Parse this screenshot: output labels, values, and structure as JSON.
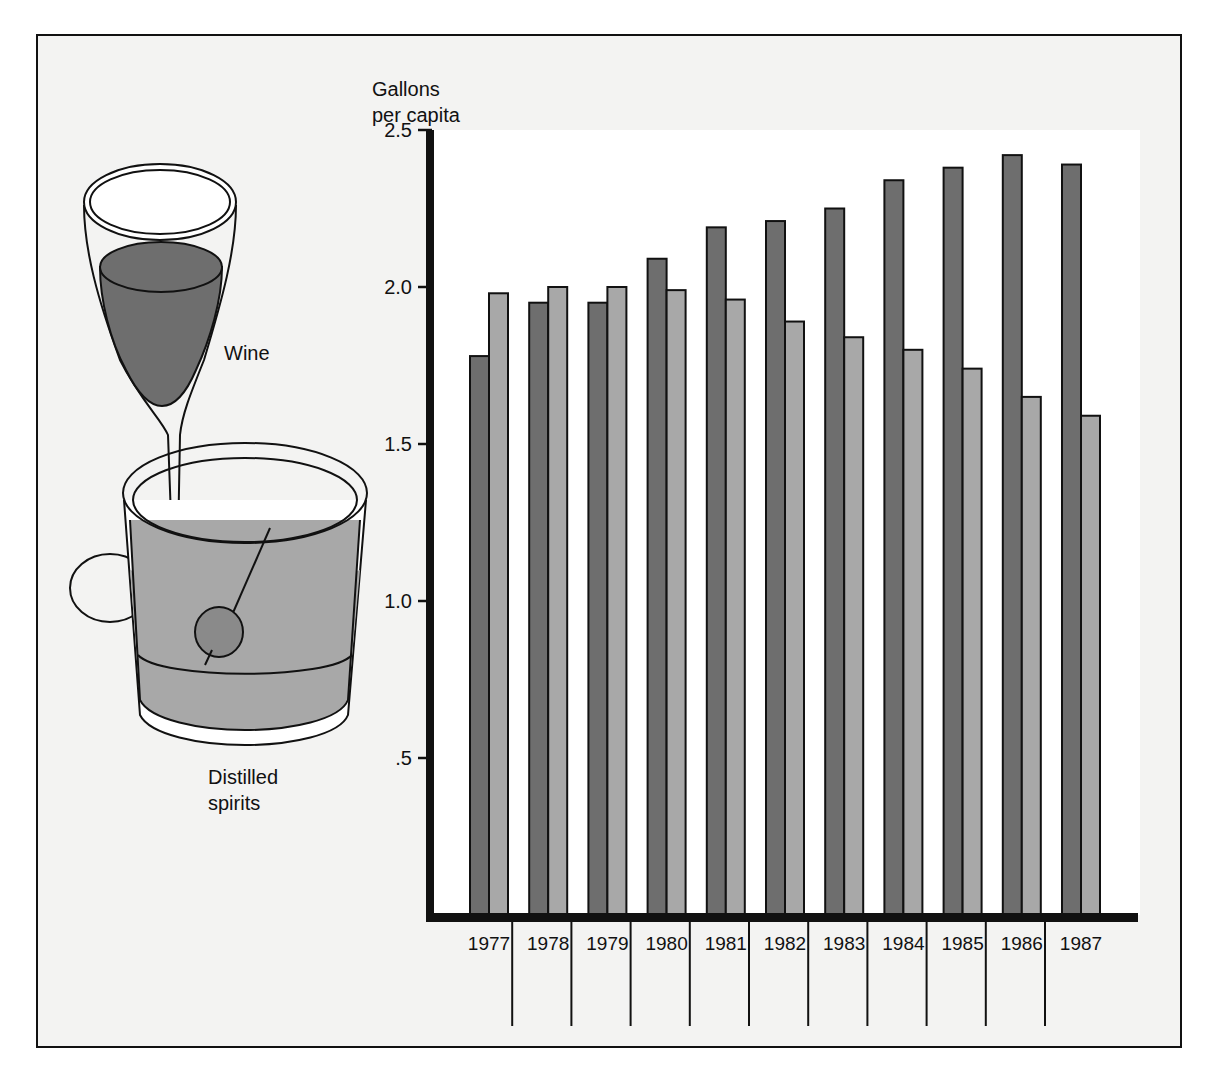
{
  "chart_data": {
    "type": "bar",
    "title": "",
    "ylabel": "Gallons per capita",
    "ylabel_lines": [
      "Gallons",
      "per capita"
    ],
    "xlabel": "",
    "ylim": [
      0,
      2.5
    ],
    "yticks": [
      {
        "value": 0.5,
        "label": ".5"
      },
      {
        "value": 1.0,
        "label": "1.0"
      },
      {
        "value": 1.5,
        "label": "1.5"
      },
      {
        "value": 2.0,
        "label": "2.0"
      },
      {
        "value": 2.5,
        "label": "2.5"
      }
    ],
    "grid": false,
    "categories": [
      "1977",
      "1978",
      "1979",
      "1980",
      "1981",
      "1982",
      "1983",
      "1984",
      "1985",
      "1986",
      "1987"
    ],
    "series": [
      {
        "name": "Wine",
        "color": "#6e6e6e",
        "values": [
          1.78,
          1.95,
          1.95,
          2.09,
          2.19,
          2.21,
          2.25,
          2.34,
          2.38,
          2.42,
          2.39
        ]
      },
      {
        "name": "Distilled spirits",
        "color": "#a8a8a8",
        "values": [
          1.98,
          2.0,
          2.0,
          1.99,
          1.96,
          1.89,
          1.84,
          1.8,
          1.74,
          1.65,
          1.59
        ]
      }
    ],
    "legend": {
      "placement": "left",
      "style": "illustration",
      "entries": [
        {
          "label": "Wine",
          "icon": "wine-glass-icon"
        },
        {
          "label_lines": [
            "Distilled",
            "spirits"
          ],
          "icon": "spirits-glass-icon"
        }
      ]
    }
  }
}
